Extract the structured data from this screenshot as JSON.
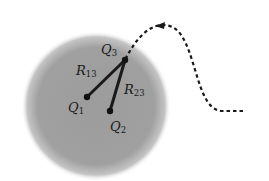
{
  "diagram": {
    "colors": {
      "region": "#9a9a9a",
      "lines": "#1a1a1a",
      "path": "#1a1a1a",
      "background": "#ffffff"
    },
    "region": {
      "cx": 96,
      "cy": 106,
      "r": 72
    },
    "charges": [
      {
        "id": "Q1",
        "name": "Q",
        "sub": "1",
        "x": 87,
        "y": 97
      },
      {
        "id": "Q2",
        "name": "Q",
        "sub": "2",
        "x": 110,
        "y": 111
      },
      {
        "id": "Q3",
        "name": "Q",
        "sub": "3",
        "x": 125,
        "y": 60
      }
    ],
    "distances": [
      {
        "id": "R13",
        "name": "R",
        "sub": "13",
        "from": "Q1",
        "to": "Q3"
      },
      {
        "id": "R23",
        "name": "R",
        "sub": "23",
        "from": "Q2",
        "to": "Q3"
      }
    ],
    "labels": {
      "q1": {
        "main": "Q",
        "sub": "1"
      },
      "q2": {
        "main": "Q",
        "sub": "2"
      },
      "q3": {
        "main": "Q",
        "sub": "3"
      },
      "r13": {
        "main": "R",
        "sub": "13"
      },
      "r23": {
        "main": "R",
        "sub": "23"
      }
    },
    "path": {
      "style": "dashed",
      "arrow_direction": "toward Q3",
      "start": [
        243,
        111
      ],
      "end": [
        125,
        60
      ]
    }
  }
}
